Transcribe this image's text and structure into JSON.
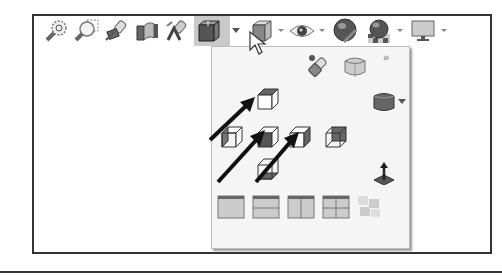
{
  "toolbar": {
    "items": [
      {
        "name": "zoom-to-fit",
        "icon": "zoom-fit-icon",
        "x": 0
      },
      {
        "name": "zoom-to-area",
        "icon": "zoom-area-icon",
        "x": 30
      },
      {
        "name": "previous-view",
        "icon": "previous-view-icon",
        "x": 60
      },
      {
        "name": "section-view",
        "icon": "section-view-icon",
        "x": 90
      },
      {
        "name": "dynamic-annotation-views",
        "icon": "annotation-view-icon",
        "x": 120
      },
      {
        "name": "view-orientation",
        "icon": "view-orientation-cube-icon",
        "x": 152,
        "active": true,
        "has_dropdown": true
      },
      {
        "name": "display-style",
        "icon": "display-style-icon",
        "x": 205,
        "has_dropdown": true
      },
      {
        "name": "hide-show-items",
        "icon": "eye-icon",
        "x": 245,
        "has_dropdown": true
      },
      {
        "name": "edit-appearance",
        "icon": "appearance-sphere-icon",
        "x": 290
      },
      {
        "name": "apply-scene",
        "icon": "scene-icon",
        "x": 325,
        "has_dropdown": true
      },
      {
        "name": "view-settings",
        "icon": "monitor-icon",
        "x": 375,
        "has_dropdown": true
      }
    ],
    "dropdown_caret": "▾"
  },
  "popup": {
    "more_label": "»",
    "top_row": [
      {
        "name": "view-selector",
        "icon": "binoculars-icon"
      },
      {
        "name": "isometric-view",
        "icon": "rounded-cube-icon"
      }
    ],
    "standard_views": {
      "top": "top-view-cube-icon",
      "left": "left-view-cube-icon",
      "front": "front-view-cube-icon",
      "right": "right-view-cube-icon",
      "back": "back-view-cube-icon",
      "bottom": "bottom-view-cube-icon"
    },
    "other_views": [
      {
        "name": "isometric",
        "icon": "shaded-cube-icon",
        "has_dropdown": true
      },
      {
        "name": "normal-to",
        "icon": "normal-to-icon"
      }
    ],
    "viewports": [
      {
        "name": "single-view",
        "icon": "single-viewport-icon"
      },
      {
        "name": "two-view-horizontal",
        "icon": "two-view-horizontal-icon"
      },
      {
        "name": "two-view-vertical",
        "icon": "two-view-vertical-icon"
      },
      {
        "name": "four-view",
        "icon": "four-view-icon"
      },
      {
        "name": "link-views",
        "icon": "link-views-icon",
        "disabled": true
      }
    ]
  },
  "annotations": {
    "arrows": 3,
    "arrow_color": "#111111"
  },
  "colors": {
    "frame": "#333333",
    "popup_bg": "#f5f5f5",
    "active_bg": "#c9c9c9"
  }
}
